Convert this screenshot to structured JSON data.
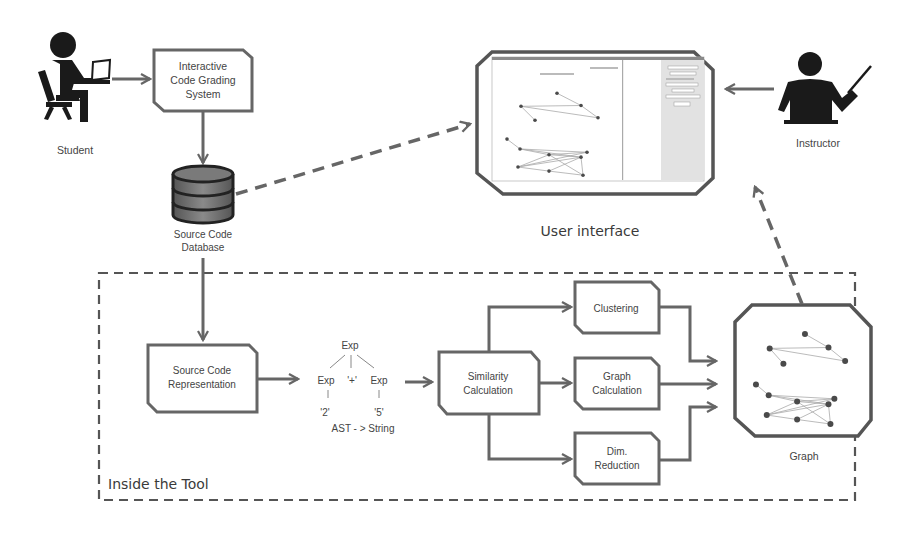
{
  "actors": {
    "student": {
      "label": "Student",
      "icon": "student-at-laptop-icon"
    },
    "instructor": {
      "label": "Instructor",
      "icon": "instructor-pointer-icon"
    }
  },
  "system_box": {
    "lines": [
      "Interactive",
      "Code Grading",
      "System"
    ]
  },
  "database": {
    "lines": [
      "Source Code",
      "Database"
    ],
    "icon": "database-icon"
  },
  "user_interface": {
    "label": "User interface",
    "icon": "ui-screenshot-thumbnail"
  },
  "tool": {
    "label": "Inside the Tool",
    "representation_box": {
      "lines": [
        "Source Code",
        "Representation"
      ]
    },
    "ast": {
      "root": "Exp",
      "left": "Exp",
      "op": "'+'",
      "right": "Exp",
      "left_leaf": "'2'",
      "right_leaf": "'5'",
      "caption": "AST - > String"
    },
    "similarity_box": {
      "lines": [
        "Similarity",
        "Calculation"
      ]
    },
    "clustering_box": {
      "lines": [
        "Clustering"
      ]
    },
    "graph_calc_box": {
      "lines": [
        "Graph",
        "Calculation"
      ]
    },
    "dim_reduction_box": {
      "lines": [
        "Dim.",
        "Reduction"
      ]
    },
    "graph_output": {
      "label": "Graph",
      "icon": "graph-network-icon"
    }
  },
  "colors": {
    "stroke": "#666666",
    "text": "#444444",
    "node": "#4a4a4a",
    "panel_gray": "#e2e2e2"
  }
}
